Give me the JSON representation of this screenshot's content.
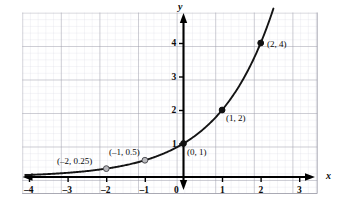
{
  "chart_data": {
    "type": "line",
    "title": "",
    "xlabel": "x",
    "ylabel": "y",
    "function": "y = 2^x",
    "xlim": [
      -4.15,
      3.5
    ],
    "ylim": [
      -0.55,
      4.75
    ],
    "grid": true,
    "grid_minor": true,
    "legend": "none",
    "xticks": [
      -4,
      -3,
      -2,
      -1,
      0,
      1,
      2,
      3
    ],
    "xticklabels": [
      "–4",
      "–3",
      "–2",
      "–1",
      "0",
      "1",
      "2",
      "3"
    ],
    "yticks": [
      1,
      2,
      3,
      4
    ],
    "yticklabels": [
      "1",
      "2",
      "3",
      "4"
    ],
    "points": [
      {
        "x": -2,
        "y": 0.25,
        "label": "(–2, 0.25)",
        "filled": false
      },
      {
        "x": -1,
        "y": 0.5,
        "label": "(–1, 0.5)",
        "filled": false
      },
      {
        "x": 0,
        "y": 1,
        "label": "(0, 1)",
        "filled": true
      },
      {
        "x": 1,
        "y": 2,
        "label": "(1, 2)",
        "filled": true
      },
      {
        "x": 2,
        "y": 4,
        "label": "(2, 4)",
        "filled": true
      }
    ],
    "curve_x_range": [
      -4.1,
      2.33
    ],
    "colors": {
      "curve": "#111111",
      "axis": "#000000",
      "grid_major": "#9a9aa5",
      "grid_minor": "#d8d8e0",
      "open_point_fill": "#b9b9bd",
      "text": "#0a0a0a"
    }
  },
  "axis_labels": {
    "x": "x",
    "y": "y"
  },
  "tick_labels": {
    "x_neg4": "–4",
    "x_neg3": "–3",
    "x_neg2": "–2",
    "x_neg1": "–1",
    "x_zero": "0",
    "x_1": "1",
    "x_2": "2",
    "x_3": "3",
    "y_1": "1",
    "y_2": "2",
    "y_3": "3",
    "y_4": "4"
  },
  "point_labels": {
    "p_neg2": "(–2, 0.25)",
    "p_neg1": "(–1, 0.5)",
    "p_0": "(0, 1)",
    "p_1": "(1, 2)",
    "p_2": "(2, 4)"
  }
}
